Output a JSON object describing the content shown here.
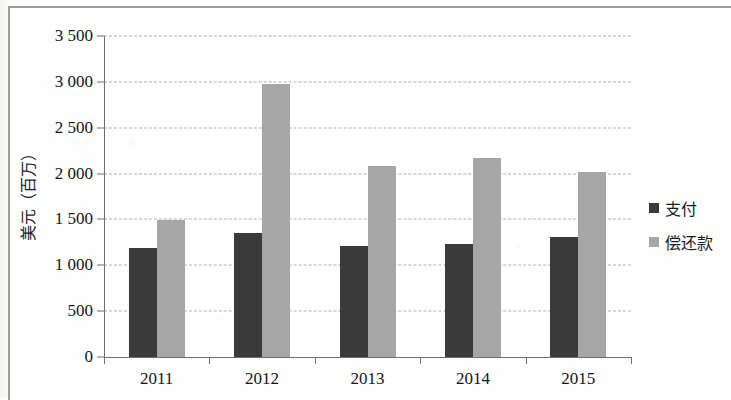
{
  "chart_data": {
    "type": "bar",
    "title": "",
    "xlabel": "",
    "ylabel": "美元（百万）",
    "categories": [
      "2011",
      "2012",
      "2013",
      "2014",
      "2015"
    ],
    "series": [
      {
        "name": "支付",
        "color": "#3a3a3a",
        "values": [
          1190,
          1355,
          1215,
          1235,
          1310
        ]
      },
      {
        "name": "偿还款",
        "color": "#a6a6a6",
        "values": [
          1495,
          2975,
          2085,
          2175,
          2020
        ]
      }
    ],
    "ylim": [
      0,
      3500
    ],
    "yticks": [
      0,
      500,
      1000,
      1500,
      2000,
      2500,
      3000,
      3500
    ],
    "ytick_labels": [
      "0",
      "500",
      "1 000",
      "1 500",
      "2 000",
      "2 500",
      "3 000",
      "3 500"
    ],
    "grid": true,
    "legend_position": "right"
  },
  "legend": {
    "items": [
      {
        "label": "支付",
        "marker": "square-dark"
      },
      {
        "label": "偿还款",
        "marker": "square-gray"
      }
    ]
  }
}
